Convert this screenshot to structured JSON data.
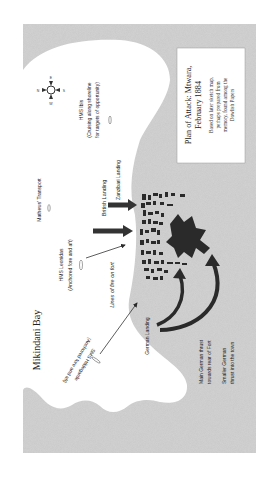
{
  "map": {
    "title_line1": "Plan of Attack: Mtwara,",
    "title_line2": "February 1884",
    "note_line1": "Based on later sketch map,",
    "note_line2": "perhaps prepared from",
    "note_line3": "memory, found among the",
    "note_line4": "Dowlish Papers",
    "bay_label": "Mikindani Bay",
    "compass": {
      "n": "N",
      "s": "S",
      "e": "E",
      "w": "W"
    },
    "ships": {
      "ibis_name": "HMS Ibis",
      "ibis_note1": "(Cruising along shoreline",
      "ibis_note2": "for targets of opportunity)",
      "transport": "Mathews' Transport",
      "leonidas_name": "HMS Leonidas",
      "leonidas_note": "(Anchored fore and aft)",
      "hildegarde_name": "SMS Hildegarde",
      "hildegarde_note": "(Anchored fore and aft)"
    },
    "labels": {
      "zanzibari_landing": "Zanzibari Landing",
      "british_landing": "British Landing",
      "lines_of_fire": "Lines of fire on fort",
      "german_landing": "German Landing",
      "main_thrust1": "Main German thrust",
      "main_thrust2": "towards rear of Fort",
      "smaller_thrust1": "Smaller German",
      "smaller_thrust2": "thrust into the town"
    },
    "colors": {
      "land": "#c4c4c4",
      "sea": "#ffffff",
      "ink": "#2a2a2a",
      "box": "#ffffff"
    }
  }
}
